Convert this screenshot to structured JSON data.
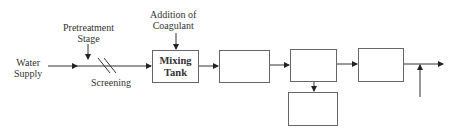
{
  "diagram": {
    "labels": {
      "water_supply": "Water\nSupply",
      "pretreatment": "Pretreatment\nStage",
      "screening": "Screening",
      "coagulant": "Addition of\nCoagulant"
    },
    "boxes": [
      {
        "id": "mixing-tank",
        "label": "Mixing\nTank"
      },
      {
        "id": "box-2",
        "label": ""
      },
      {
        "id": "box-3",
        "label": ""
      },
      {
        "id": "box-4",
        "label": ""
      },
      {
        "id": "box-5",
        "label": ""
      }
    ],
    "colors": {
      "line": "#333333",
      "box_border": "#666666"
    }
  }
}
